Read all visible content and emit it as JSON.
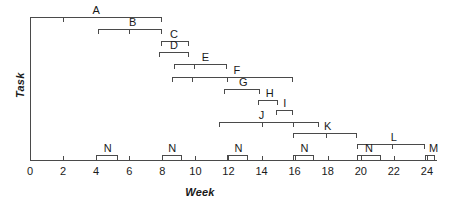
{
  "chart_data": {
    "type": "bar",
    "chart_kind": "gantt",
    "title": "",
    "xlabel": "Week",
    "ylabel": "Task",
    "xlim": [
      0,
      24.6
    ],
    "ylim": [
      0,
      13
    ],
    "grid": false,
    "legend": "none",
    "x_ticks": [
      0,
      2,
      4,
      6,
      8,
      10,
      12,
      14,
      16,
      18,
      20,
      22,
      24
    ],
    "x_tick_labels": [
      "0",
      "2",
      "4",
      "6",
      "8",
      "10",
      "12",
      "14",
      "16",
      "18",
      "20",
      "22",
      "24"
    ],
    "y_ticks": [],
    "y_tick_labels": [],
    "categories": [
      "A",
      "B",
      "C",
      "D",
      "E",
      "F",
      "G",
      "H",
      "I",
      "J",
      "K",
      "L",
      "M",
      "N",
      "N",
      "N",
      "N",
      "N"
    ],
    "bars": [
      {
        "label": "A",
        "start": 0.0,
        "end": 8.0,
        "row": 0,
        "label_x": 4.0,
        "interior_ticks": [
          2.0
        ]
      },
      {
        "label": "B",
        "start": 4.1,
        "end": 8.0,
        "row": 1,
        "label_x": 6.2,
        "interior_ticks": [
          6.0
        ]
      },
      {
        "label": "C",
        "start": 7.9,
        "end": 9.6,
        "row": 2,
        "label_x": 8.7,
        "interior_ticks": []
      },
      {
        "label": "D",
        "start": 7.8,
        "end": 9.6,
        "row": 3,
        "label_x": 8.7,
        "interior_ticks": []
      },
      {
        "label": "E",
        "start": 8.7,
        "end": 11.9,
        "row": 4,
        "label_x": 10.6,
        "interior_ticks": [
          9.9
        ]
      },
      {
        "label": "F",
        "start": 8.6,
        "end": 15.9,
        "row": 5,
        "label_x": 12.5,
        "interior_ticks": [
          9.8,
          11.9
        ]
      },
      {
        "label": "G",
        "start": 11.7,
        "end": 13.9,
        "row": 6,
        "label_x": 12.9,
        "interior_ticks": []
      },
      {
        "label": "H",
        "start": 13.8,
        "end": 15.0,
        "row": 7,
        "label_x": 14.5,
        "interior_ticks": []
      },
      {
        "label": "I",
        "start": 14.9,
        "end": 15.9,
        "row": 8,
        "label_x": 15.4,
        "interior_ticks": []
      },
      {
        "label": "J",
        "start": 11.4,
        "end": 17.5,
        "row": 9,
        "label_x": 14.0,
        "interior_ticks": [
          14.0,
          15.9
        ]
      },
      {
        "label": "K",
        "start": 15.9,
        "end": 19.8,
        "row": 10,
        "label_x": 18.0,
        "interior_ticks": [
          17.9
        ]
      },
      {
        "label": "L",
        "start": 19.8,
        "end": 23.9,
        "row": 11,
        "label_x": 22.0,
        "interior_ticks": [
          21.9
        ]
      },
      {
        "label": "M",
        "start": 23.9,
        "end": 24.5,
        "row": 12,
        "label_x": 24.4,
        "interior_ticks": []
      },
      {
        "label": "N",
        "start": 4.0,
        "end": 5.3,
        "row": 12,
        "label_x": 4.7,
        "interior_ticks": []
      },
      {
        "label": "N",
        "start": 8.0,
        "end": 9.2,
        "row": 12,
        "label_x": 8.6,
        "interior_ticks": []
      },
      {
        "label": "N",
        "start": 11.9,
        "end": 13.2,
        "row": 12,
        "label_x": 12.6,
        "interior_ticks": []
      },
      {
        "label": "N",
        "start": 15.9,
        "end": 17.2,
        "row": 12,
        "label_x": 16.6,
        "interior_ticks": []
      },
      {
        "label": "N",
        "start": 19.8,
        "end": 21.2,
        "row": 12,
        "label_x": 20.5,
        "interior_ticks": []
      }
    ],
    "colors": {
      "axis": "#4a4a4a",
      "bar": "#4a4a4a",
      "text": "#1a1a1a",
      "background": "#ffffff"
    }
  },
  "geometry": {
    "origin_x": 30,
    "px_per_week": 16.54,
    "axis_top_y": 17,
    "axis_bottom_y": 160,
    "row_tops": [
      17,
      29,
      41,
      52,
      64,
      77,
      89,
      100,
      110,
      122,
      133,
      144,
      155
    ],
    "tick_label_y": 166,
    "x_title_x": 200,
    "x_title_y": 186,
    "y_title_x": 14,
    "y_title_y": 98
  }
}
